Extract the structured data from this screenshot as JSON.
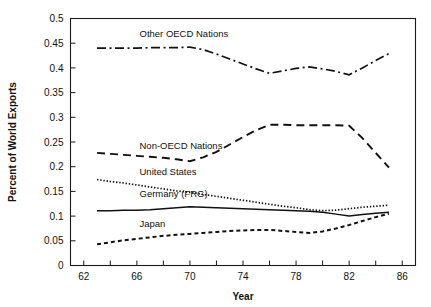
{
  "chart_data": {
    "type": "line",
    "title": "",
    "xlabel": "Year",
    "ylabel": "Percent of World Exports",
    "xlim": [
      61,
      87
    ],
    "ylim": [
      0,
      0.5
    ],
    "grid": false,
    "legend_position": "inline-labels",
    "x_ticks": [
      62,
      64,
      66,
      68,
      70,
      72,
      74,
      76,
      78,
      80,
      82,
      84,
      86
    ],
    "x_tick_labels": [
      "62",
      "",
      "66",
      "",
      "70",
      "",
      "74",
      "",
      "78",
      "",
      "82",
      "",
      "86"
    ],
    "y_ticks": [
      0,
      0.05,
      0.1,
      0.15,
      0.2,
      0.25,
      0.3,
      0.35,
      0.4,
      0.45,
      0.5
    ],
    "y_tick_labels": [
      "0",
      "0.05",
      "0.1",
      "0.15",
      "0.2",
      "0.25",
      "0.3",
      "0.35",
      "0.4",
      "0.45",
      "0.5"
    ],
    "x": [
      63,
      64,
      65,
      66,
      67,
      68,
      69,
      70,
      71,
      72,
      73,
      74,
      75,
      76,
      77,
      78,
      79,
      80,
      81,
      82,
      83,
      84,
      85
    ],
    "series": [
      {
        "name": "Other OECD Nations",
        "style": "dash-dot",
        "label_x": 66.2,
        "label_y": 0.462,
        "values": [
          0.44,
          0.44,
          0.44,
          0.44,
          0.441,
          0.441,
          0.441,
          0.442,
          0.437,
          0.428,
          0.418,
          0.408,
          0.398,
          0.389,
          0.394,
          0.399,
          0.402,
          0.398,
          0.393,
          0.386,
          0.4,
          0.415,
          0.429
        ]
      },
      {
        "name": "Non-OECD Nations",
        "style": "dashed",
        "label_x": 66.2,
        "label_y": 0.236,
        "values": [
          0.228,
          0.226,
          0.224,
          0.222,
          0.22,
          0.218,
          0.215,
          0.211,
          0.219,
          0.23,
          0.245,
          0.26,
          0.274,
          0.285,
          0.285,
          0.284,
          0.284,
          0.284,
          0.284,
          0.283,
          0.258,
          0.228,
          0.198
        ]
      },
      {
        "name": "United States",
        "style": "dotted-fine",
        "label_x": 66.2,
        "label_y": 0.183,
        "values": [
          0.174,
          0.17,
          0.167,
          0.163,
          0.159,
          0.155,
          0.151,
          0.148,
          0.144,
          0.14,
          0.136,
          0.132,
          0.128,
          0.124,
          0.12,
          0.117,
          0.113,
          0.111,
          0.112,
          0.115,
          0.118,
          0.12,
          0.122
        ]
      },
      {
        "name": "Germany (FRG)",
        "style": "solid",
        "label_x": 66.2,
        "label_y": 0.139,
        "values": [
          0.111,
          0.111,
          0.112,
          0.112,
          0.113,
          0.115,
          0.117,
          0.119,
          0.118,
          0.117,
          0.116,
          0.115,
          0.114,
          0.113,
          0.112,
          0.111,
          0.11,
          0.108,
          0.104,
          0.1,
          0.103,
          0.106,
          0.108
        ]
      },
      {
        "name": "Japan",
        "style": "dotted-coarse",
        "label_x": 66.2,
        "label_y": 0.078,
        "values": [
          0.043,
          0.047,
          0.051,
          0.054,
          0.057,
          0.06,
          0.062,
          0.064,
          0.066,
          0.068,
          0.07,
          0.071,
          0.072,
          0.072,
          0.07,
          0.068,
          0.066,
          0.069,
          0.075,
          0.082,
          0.09,
          0.098,
          0.105
        ]
      }
    ]
  },
  "axes": {
    "x_title": "Year",
    "y_title": "Percent of World Exports"
  }
}
